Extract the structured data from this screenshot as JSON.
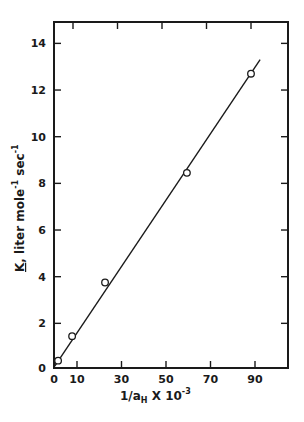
{
  "chart_data": {
    "type": "scatter",
    "title": "",
    "xlabel": "1/a_H X 10^-3",
    "xlabel_parts": {
      "main": "1/a",
      "sub": "H",
      "mid": " X 10",
      "sup": "-3"
    },
    "ylabel": "K, liter mole^-1 sec^-1",
    "ylabel_parts": {
      "k": "K",
      "rest1": ", liter mole",
      "sup1": "-1",
      "rest2": " sec",
      "sup2": "-1"
    },
    "xlim": [
      0,
      105
    ],
    "ylim": [
      0,
      15
    ],
    "xticks": [
      0,
      10,
      30,
      50,
      70,
      90
    ],
    "yticks": [
      0,
      2,
      4,
      6,
      8,
      10,
      12,
      14
    ],
    "grid": false,
    "legend": null,
    "series": [
      {
        "name": "measured",
        "marker": "open-circle",
        "x": [
          1.5,
          7.8,
          22.6,
          59.4,
          88.2
        ],
        "y": [
          0.4,
          1.45,
          3.75,
          8.45,
          12.7
        ]
      },
      {
        "name": "linear-fit",
        "style": "line",
        "x": [
          0,
          92.3
        ],
        "y": [
          0.17,
          13.3
        ]
      }
    ]
  }
}
